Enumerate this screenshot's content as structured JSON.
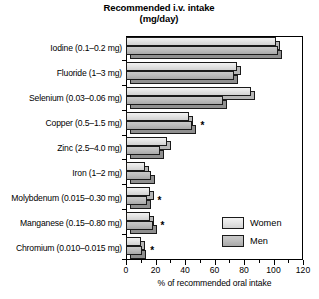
{
  "chart_data": {
    "type": "bar",
    "orientation": "horizontal",
    "title": "Recommended i.v. intake",
    "subtitle": "(mg/day)",
    "xlabel": "% of recommended oral intake",
    "ylabel": "",
    "xlim": [
      0,
      120
    ],
    "xticks": [
      0,
      20,
      40,
      60,
      80,
      100,
      120
    ],
    "xtick_labels": [
      "0",
      "20",
      "40",
      "60",
      "80",
      "100",
      "120"
    ],
    "minor_tick_step": 10,
    "grid": false,
    "legend_position": "lower right",
    "categories": [
      "Iodine (0.1–0.2 mg)",
      "Fluoride (1–3 mg)",
      "Selenium (0.03–0.06 mg)",
      "Copper (0.5–1.5 mg)",
      "Zinc (2.5–4.0 mg)",
      "Iron (1–2 mg)",
      "Molybdenum (0.015–0.30 mg)",
      "Manganese (0.15–0.80 mg)",
      "Chromium (0.010–0.015 mg)"
    ],
    "series": [
      {
        "name": "Women",
        "color": "#e4e4e4",
        "values": [
          102,
          75,
          85,
          43,
          28,
          13,
          16,
          16,
          10
        ]
      },
      {
        "name": "Men",
        "color": "#bdbdbd",
        "values": [
          103,
          73,
          66,
          45,
          23,
          17,
          14,
          18,
          11
        ]
      }
    ],
    "annotations": [
      {
        "category": "Copper (0.5–1.5 mg)",
        "marker": "*"
      },
      {
        "category": "Molybdenum (0.015–0.30 mg)",
        "marker": "*"
      },
      {
        "category": "Manganese (0.15–0.80 mg)",
        "marker": "*"
      },
      {
        "category": "Chromium (0.010–0.015 mg)",
        "marker": "*"
      }
    ]
  },
  "legend": {
    "items": [
      {
        "label": "Women",
        "color": "#e4e4e4"
      },
      {
        "label": "Men",
        "color": "#bdbdbd"
      }
    ]
  }
}
